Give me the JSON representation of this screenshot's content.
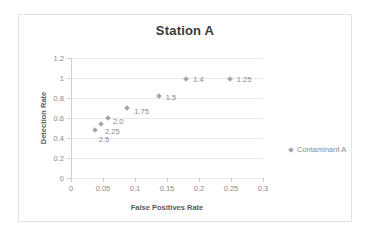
{
  "chart_data": {
    "type": "scatter",
    "title": "Station A",
    "xlabel": "False Positives Rate",
    "ylabel": "Detection Rate",
    "xlim": [
      0,
      0.3
    ],
    "ylim": [
      0,
      1.2
    ],
    "xticks": [
      "0",
      "0.05",
      "0.1",
      "0.15",
      "0.2",
      "0.25",
      "0.3"
    ],
    "xtick_values": [
      0,
      0.05,
      0.1,
      0.15,
      0.2,
      0.25,
      0.3
    ],
    "yticks": [
      "0",
      "0.2",
      "0.4",
      "0.6",
      "0.8",
      "1",
      "1.2"
    ],
    "ytick_values": [
      0,
      0.2,
      0.4,
      0.6,
      0.8,
      1,
      1.2
    ],
    "grid": true,
    "legend_position": "right",
    "marker_color": "#a6a6a6",
    "series": [
      {
        "name": "Contaminant A",
        "points": [
          {
            "x": 0.037,
            "y": 0.48,
            "label": "2.5",
            "label_dx": 4,
            "label_dy": 9
          },
          {
            "x": 0.047,
            "y": 0.545,
            "label": "2.25",
            "label_dx": 4,
            "label_dy": 7
          },
          {
            "x": 0.058,
            "y": 0.605,
            "label": "2.0",
            "label_dx": 5,
            "label_dy": 3
          },
          {
            "x": 0.088,
            "y": 0.7,
            "label": "1.75",
            "label_dx": 7,
            "label_dy": 3
          },
          {
            "x": 0.137,
            "y": 0.825,
            "label": "1.5",
            "label_dx": 7,
            "label_dy": 1
          },
          {
            "x": 0.18,
            "y": 0.99,
            "label": "1.4",
            "label_dx": 7,
            "label_dy": 0
          },
          {
            "x": 0.248,
            "y": 0.99,
            "label": "1.25",
            "label_dx": 7,
            "label_dy": 0
          }
        ]
      }
    ]
  },
  "legend": {
    "entries": [
      {
        "label": "Contaminant A"
      }
    ]
  }
}
